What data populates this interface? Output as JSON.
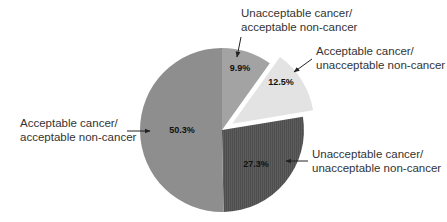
{
  "chart_data": {
    "type": "pie",
    "title": "",
    "categories": [
      "Unacceptable cancer/acceptable non-cancer",
      "Acceptable cancer/unacceptable non-cancer",
      "Unacceptable cancer/unacceptable non-cancer",
      "Acceptable cancer/acceptable non-cancer"
    ],
    "values": [
      9.9,
      12.5,
      27.3,
      50.3
    ],
    "value_labels": [
      "9.9%",
      "12.5%",
      "27.3%",
      "50.3%"
    ],
    "exploded": [
      false,
      true,
      false,
      false
    ],
    "start_angle": "12 o'clock, clockwise",
    "colors": [
      "#a3a3a3",
      "#e3e3e3",
      "#5a5a5a",
      "#8e8e8e"
    ],
    "legend": "callout labels with arrows"
  },
  "labels": {
    "s0": {
      "line1": "Unacceptable cancer/",
      "line2": "acceptable non-cancer",
      "pct": "9.9%"
    },
    "s1": {
      "line1": "Acceptable cancer/",
      "line2": "unacceptable non-cancer",
      "pct": "12.5%"
    },
    "s2": {
      "line1": "Unacceptable cancer/",
      "line2": "unacceptable non-cancer",
      "pct": "27.3%"
    },
    "s3": {
      "line1": "Acceptable cancer/",
      "line2": "acceptable non-cancer",
      "pct": "50.3%"
    }
  }
}
